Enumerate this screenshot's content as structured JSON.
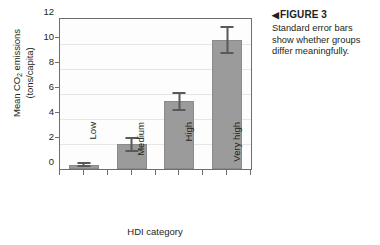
{
  "figure": {
    "caption_marker": "◀",
    "caption_title": "FIGURE 3",
    "caption_text": "Standard error bars show whether groups differ meaningfully."
  },
  "chart_data": {
    "type": "bar",
    "title": "",
    "xlabel": "HDI category",
    "ylabel_line1": "Mean CO",
    "ylabel_sub": "2",
    "ylabel_line1_rest": " emissions",
    "ylabel_line2": "(tons/capita)",
    "ylabel_full": "Mean CO2 emissions (tons/capita)",
    "categories": [
      "Low",
      "Medium",
      "High",
      "Very high"
    ],
    "values": [
      0.3,
      1.95,
      5.4,
      10.25
    ],
    "error_low": [
      0.1,
      1.35,
      4.6,
      9.2
    ],
    "error_high": [
      0.5,
      2.5,
      6.1,
      11.4
    ],
    "error_type": "standard error",
    "ylim": [
      0,
      12
    ],
    "yticks": [
      0,
      2,
      4,
      6,
      8,
      10,
      12
    ],
    "ytick_labels": [
      "0",
      "2",
      "4",
      "6",
      "8",
      "10",
      "12"
    ],
    "grid": true,
    "legend": "none",
    "bar_color": "#9b9b9b",
    "error_color": "#58595b",
    "axis_color": "#6d6e70",
    "grid_color": "#e6e6e7",
    "plot_background": "#fdfdfd"
  }
}
